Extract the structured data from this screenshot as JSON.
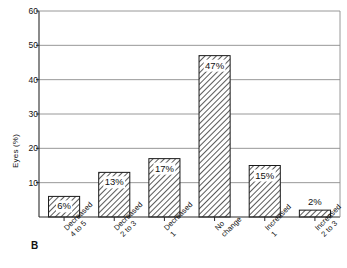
{
  "panel": {
    "label": "B"
  },
  "chart_data": {
    "type": "bar",
    "title": "",
    "xlabel": "",
    "ylabel": "Eyes (%)",
    "ylim": [
      0,
      60
    ],
    "yticks": [
      10,
      20,
      30,
      40,
      50,
      60
    ],
    "grid": true,
    "legend": "none",
    "categories": [
      "Decreased\n4 to 5",
      "Decreased\n2 to 3",
      "Decreased\n1",
      "No\nchange",
      "Increased\n1",
      "Increased\n2 to 3"
    ],
    "category_lines": [
      [
        "Decreased",
        "4 to 5"
      ],
      [
        "Decreased",
        "2 to 3"
      ],
      [
        "Decreased",
        "1"
      ],
      [
        "No",
        "change"
      ],
      [
        "Increased",
        "1"
      ],
      [
        "Increased",
        "2 to 3"
      ]
    ],
    "values": [
      6,
      13,
      17,
      47,
      15,
      2
    ],
    "data_labels": [
      "6%",
      "13%",
      "17%",
      "47%",
      "15%",
      "2%"
    ],
    "bar_style": {
      "fill": "#ffffff",
      "hatch": "diagonal",
      "hatch_color": "#555555",
      "edge_color": "#1a1a1a"
    },
    "axis_color": "#2b2b2b",
    "grid_color": "#8c8c8c"
  }
}
